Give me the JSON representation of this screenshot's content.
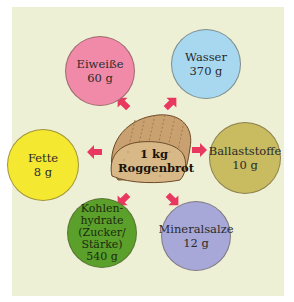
{
  "center": {
    "amount": "1 kg",
    "name": "Roggenbrot"
  },
  "components": [
    {
      "id": "eiweisse",
      "name": "Eiweiße",
      "amount": "60 g",
      "color": "#f08aa8"
    },
    {
      "id": "wasser",
      "name": "Wasser",
      "amount": "370 g",
      "color": "#a8d8f0"
    },
    {
      "id": "fette",
      "name": "Fette",
      "amount": "8 g",
      "color": "#f5e830"
    },
    {
      "id": "ballaststoffe",
      "name": "Ballaststoffe",
      "amount": "10 g",
      "color": "#c8bb60"
    },
    {
      "id": "kohlenhydrate",
      "name_lines": [
        "Kohlen-",
        "hydrate",
        "(Zucker/",
        "Stärke)"
      ],
      "amount": "540 g",
      "color": "#5aa02a"
    },
    {
      "id": "mineralsalze",
      "name": "Mineralsalze",
      "amount": "12 g",
      "color": "#a8a8d8"
    }
  ],
  "colors": {
    "background_panel": "#eef0d6",
    "arrow": "#e8385f",
    "bread": "#c9a070"
  }
}
